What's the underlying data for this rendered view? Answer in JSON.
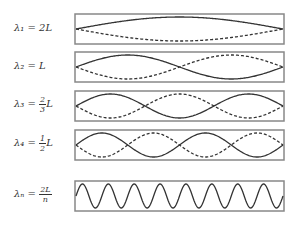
{
  "modes": [
    {
      "label_prefix": "λ₁ = ",
      "label_value": "2L",
      "top": 13,
      "half_waves": 1,
      "dashed": true
    },
    {
      "label_prefix": "λ₂ = ",
      "label_value": "L",
      "top": 51,
      "half_waves": 2,
      "dashed": true
    },
    {
      "label_prefix": "λ₃ = ",
      "num": "2",
      "den": "3",
      "suffix": "L",
      "top": 90,
      "half_waves": 3,
      "dashed": true
    },
    {
      "label_prefix": "λ₄ = ",
      "num": "1",
      "den": "2",
      "suffix": "L",
      "top": 129,
      "half_waves": 4,
      "dashed": true
    },
    {
      "label_prefix": "λₙ = ",
      "num": "2L",
      "den": "n",
      "suffix": "",
      "top": 180,
      "half_waves": 16,
      "dashed": false
    }
  ],
  "colors": {
    "frame": "#888888",
    "wave": "#333333"
  }
}
